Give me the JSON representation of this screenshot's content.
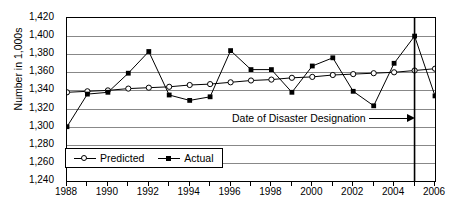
{
  "chart_data": {
    "type": "line",
    "title": "",
    "xlabel": "",
    "ylabel": "Number in 1,000s",
    "xlim": [
      1988,
      2006
    ],
    "ylim": [
      1240,
      1420
    ],
    "yticks": [
      "1,420",
      "1,400",
      "1,380",
      "1,360",
      "1,340",
      "1,320",
      "1,300",
      "1,280",
      "1,260",
      "1,240"
    ],
    "ytick_values": [
      1420,
      1400,
      1380,
      1360,
      1340,
      1320,
      1300,
      1280,
      1260,
      1240
    ],
    "xticks": [
      "1988",
      "1990",
      "1992",
      "1994",
      "1996",
      "1998",
      "2000",
      "2002",
      "2004",
      "2006"
    ],
    "xtick_values": [
      1988,
      1990,
      1992,
      1994,
      1996,
      1998,
      2000,
      2002,
      2004,
      2006
    ],
    "grid": "horizontal",
    "legend_position": "lower-left-inside",
    "x": [
      1988,
      1989,
      1990,
      1991,
      1992,
      1993,
      1994,
      1995,
      1996,
      1997,
      1998,
      1999,
      2000,
      2001,
      2002,
      2003,
      2004,
      2005,
      2006
    ],
    "series": [
      {
        "name": "Predicted",
        "marker": "open-circle",
        "values": [
          1338,
          1339,
          1340,
          1342,
          1343,
          1344,
          1346,
          1347,
          1349,
          1351,
          1352,
          1354,
          1355,
          1357,
          1358,
          1359,
          1360,
          1362,
          1364
        ]
      },
      {
        "name": "Actual",
        "marker": "filled-square",
        "values": [
          1300,
          1336,
          1338,
          1359,
          1383,
          1335,
          1329,
          1333,
          1384,
          1363,
          1363,
          1338,
          1367,
          1376,
          1339,
          1323,
          1370,
          1400,
          1334
        ]
      }
    ],
    "annotations": [
      {
        "text": "Date of Disaster Designation",
        "arrow": "right",
        "target_x": 2005,
        "vline_x": 2005
      }
    ]
  },
  "legend": {
    "items": [
      {
        "label": "Predicted",
        "marker": "open-circle"
      },
      {
        "label": "Actual",
        "marker": "filled-square"
      }
    ]
  }
}
